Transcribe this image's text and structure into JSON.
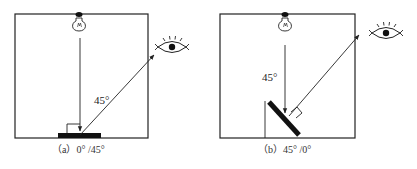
{
  "figure": {
    "panels": [
      {
        "id": "a",
        "caption": "（a）0°  /45°",
        "angle_label": "45°",
        "illumination_angle": "0°",
        "viewing_angle": "45°",
        "elements": [
          "light-bulb",
          "incident-ray-vertical",
          "flat-sample",
          "right-angle-mark",
          "reflected-ray-45deg",
          "eye-observer"
        ]
      },
      {
        "id": "b",
        "caption": "（b）45°  /0°",
        "angle_label": "45°",
        "illumination_angle": "45°",
        "viewing_angle": "0°",
        "elements": [
          "light-bulb",
          "incident-ray-vertical",
          "tilted-sample",
          "right-angle-mark",
          "reflected-ray-normal",
          "eye-observer"
        ]
      }
    ],
    "colors": {
      "line": "#222222",
      "sample": "#111111",
      "background": "#ffffff"
    }
  }
}
